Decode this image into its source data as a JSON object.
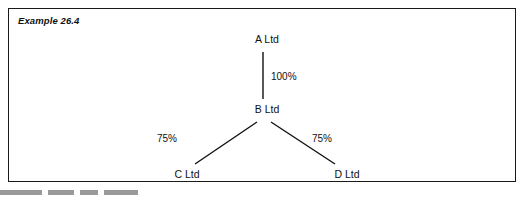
{
  "example": {
    "label": "Example 26.4"
  },
  "diagram": {
    "type": "group-structure-tree",
    "nodes": [
      {
        "id": "A",
        "label": "A Ltd",
        "x": 262,
        "y": 32
      },
      {
        "id": "B",
        "label": "B Ltd",
        "x": 262,
        "y": 101
      },
      {
        "id": "C",
        "label": "C Ltd",
        "x": 182,
        "y": 173
      },
      {
        "id": "D",
        "label": "D Ltd",
        "x": 343,
        "y": 173
      }
    ],
    "edges": [
      {
        "from": "A",
        "to": "B",
        "label": "100%",
        "label_x": 288,
        "label_y": 69
      },
      {
        "from": "B",
        "to": "C",
        "label": "75%",
        "label_x": 174,
        "label_y": 133
      },
      {
        "from": "B",
        "to": "D",
        "label": "75%",
        "label_x": 322,
        "label_y": 133
      }
    ],
    "line_color": "#111111"
  },
  "footer": {
    "marks": [
      {
        "x": 0,
        "width": 42
      },
      {
        "x": 48,
        "width": 26
      },
      {
        "x": 80,
        "width": 18
      },
      {
        "x": 104,
        "width": 34
      }
    ]
  }
}
